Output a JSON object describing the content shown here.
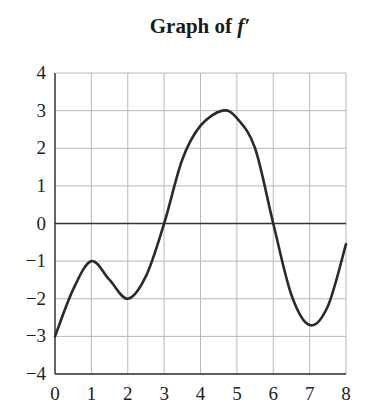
{
  "chart_data": {
    "type": "line",
    "title": "Graph of f′",
    "title_prefix": "Graph of ",
    "title_function": "f′",
    "xlabel": "",
    "ylabel": "",
    "xlim": [
      0,
      8
    ],
    "ylim": [
      -4,
      4
    ],
    "x_ticks": [
      "0",
      "1",
      "2",
      "3",
      "4",
      "5",
      "6",
      "7",
      "8"
    ],
    "y_ticks": [
      "4",
      "3",
      "2",
      "1",
      "0",
      "-1",
      "-2",
      "-3",
      "-4"
    ],
    "y_tick_labels": [
      "4",
      "3",
      "2",
      "1",
      "0",
      "−1",
      "−2",
      "−3",
      "−4"
    ],
    "grid": true,
    "legend": null,
    "series": [
      {
        "name": "f′(x)",
        "x": [
          0,
          0.5,
          1,
          1.5,
          2,
          2.5,
          3,
          3.5,
          4,
          4.6,
          5,
          5.5,
          6,
          6.5,
          7,
          7.5,
          8
        ],
        "y": [
          -3,
          -1.75,
          -1,
          -1.5,
          -2,
          -1.4,
          0,
          1.7,
          2.6,
          3,
          2.8,
          2,
          0,
          -1.9,
          -2.7,
          -2.2,
          -0.55
        ]
      }
    ],
    "key_points": [
      {
        "x": 0,
        "y": -3,
        "note": "start"
      },
      {
        "x": 1,
        "y": -1,
        "note": "local max"
      },
      {
        "x": 2,
        "y": -2,
        "note": "local min"
      },
      {
        "x": 3,
        "y": 0,
        "note": "zero"
      },
      {
        "x": 4.6,
        "y": 3,
        "note": "max"
      },
      {
        "x": 6,
        "y": 0,
        "note": "zero"
      },
      {
        "x": 7,
        "y": -2.7,
        "note": "min"
      },
      {
        "x": 8,
        "y": -0.55,
        "note": "end"
      }
    ],
    "colors": {
      "curve": "#2a2a2a",
      "grid": "#b8b8b8",
      "axis": "#333333"
    }
  }
}
